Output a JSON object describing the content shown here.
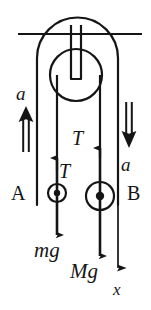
{
  "figure": {
    "kind": "physics-free-body-diagram",
    "width": 151,
    "height": 310,
    "background_color": "#ffffff",
    "ink_color": "#151515"
  },
  "labels": {
    "accel_left": "a",
    "accel_right": "a",
    "body_left": "A",
    "body_right": "B",
    "tension_left": "T",
    "tension_right": "T",
    "weight_left": "mg",
    "weight_right": "Mg",
    "axis": "x"
  },
  "structure": {
    "ceiling_label": "ceiling-line",
    "bracket_label": "pulley-bracket",
    "hanger_label": "pulley-hanger-bar",
    "wheel_label": "pulley-wheel",
    "rope_left_label": "rope-left-strand",
    "rope_right_label": "rope-right-strand"
  },
  "geometry": {
    "ceiling": {
      "x1": 18,
      "x2": 142,
      "y": 34
    },
    "bracket": {
      "left_x": 37,
      "right_x": 118,
      "top_y": 18,
      "bottom_y": 205,
      "arch_radius": 40
    },
    "hanger": {
      "x1": 71,
      "x2": 81,
      "top_y": 26,
      "bottom_y": 80
    },
    "wheel": {
      "cx": 76,
      "cy": 75,
      "r": 26
    },
    "rope_left_x": 57,
    "rope_right_x": 100,
    "body_a": {
      "cx": 57,
      "cy": 193,
      "r": 9,
      "dot_r": 3
    },
    "body_b": {
      "cx": 100,
      "cy": 196,
      "r": 14,
      "dot_r": 4
    },
    "accel_arrow_left": {
      "x": 26,
      "y_tail": 150,
      "y_tip": 108
    },
    "accel_arrow_right": {
      "x": 129,
      "y_tail": 104,
      "y_tip": 146
    },
    "axis_arrow": {
      "x": 118,
      "y_tail": 205,
      "y_tip": 278
    }
  }
}
